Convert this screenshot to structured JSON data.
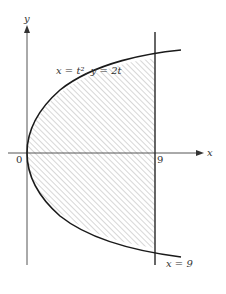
{
  "diagram": {
    "curve_label": "x = t², y = 2t",
    "line_label": "x = 9",
    "origin_label": "0",
    "x_tick_label": "9",
    "x_axis_label": "x",
    "y_axis_label": "y",
    "colors": {
      "curve": "#1a1a1a",
      "axis": "#555555",
      "hatch": "#9a9a9a",
      "line": "#333333"
    }
  }
}
